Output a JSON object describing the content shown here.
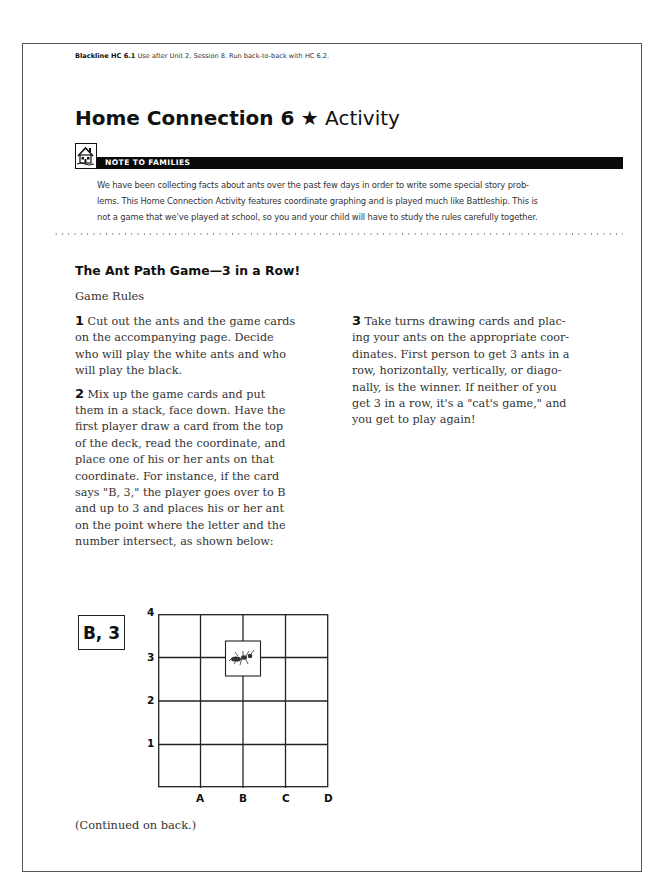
{
  "header": {
    "blackline_label": "Blackline HC 6.1",
    "blackline_note": "Use after Unit 2, Session 8. Run back-to-back with HC 6.2."
  },
  "title": {
    "bold": "Home Connection 6",
    "star": "★",
    "light": "Activity"
  },
  "note": {
    "icon": "house-icon",
    "label": "NOTE TO FAMILIES",
    "lines": [
      "We have been collecting facts about ants over the past few days in order to write some special story prob-",
      "lems. This Home Connection Activity features coordinate graphing and is played much like Battleship. This is",
      "not a game that we've played at school, so you and your child will have to study the rules carefully together."
    ]
  },
  "section": {
    "heading": "The Ant Path Game—3 in a Row!",
    "subheading": "Game Rules"
  },
  "steps": [
    {
      "number": "1",
      "lines": [
        "Cut out the ants and the game cards",
        "on the accompanying page. Decide",
        "who will play the white ants and who",
        "will play the black."
      ]
    },
    {
      "number": "2",
      "lines": [
        "Mix up the game cards and put",
        "them in a stack, face down. Have the",
        "first player draw a card from the top",
        "of the deck, read the coordinate, and",
        "place one of his or her ants on that",
        "coordinate. For instance, if the card",
        "says \"B, 3,\" the player goes over to B",
        "and up to 3 and places his or her ant",
        "on the point where the letter and the",
        "number intersect, as shown below:"
      ]
    },
    {
      "number": "3",
      "lines": [
        "Take turns drawing cards and plac-",
        "ing your ants on the appropriate coor-",
        "dinates. First person to get 3 ants in a",
        "row, horizontally, vertically, or diago-",
        "nally, is the winner. If neither of you",
        "get 3 in a row, it's a \"cat's game,\" and",
        "you get to play again!"
      ]
    }
  ],
  "example": {
    "card_label": "B, 3",
    "y_labels": [
      "4",
      "3",
      "2",
      "1"
    ],
    "x_labels": [
      "A",
      "B",
      "C",
      "D"
    ],
    "ant_position": {
      "x": "B",
      "y": "3"
    },
    "ant_icon": "ant-icon"
  },
  "footer": {
    "continued": "(Continued on back.)"
  }
}
